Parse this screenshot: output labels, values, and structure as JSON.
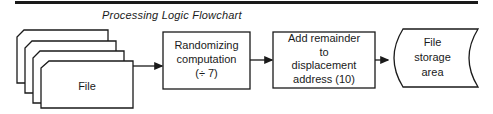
{
  "title": "Processing Logic Flowchart",
  "nodes": [
    {
      "id": "file",
      "shape": "stacked-cards",
      "label": "File",
      "count": 4
    },
    {
      "id": "randomizing",
      "shape": "process",
      "lines": [
        "Randomizing",
        "computation",
        "(÷ 7)"
      ]
    },
    {
      "id": "add-remainder",
      "shape": "process",
      "lines": [
        "Add remainder",
        "to",
        "displacement",
        "address (10)"
      ]
    },
    {
      "id": "storage",
      "shape": "stored-data",
      "lines": [
        "File",
        "storage",
        "area"
      ]
    }
  ],
  "edges": [
    {
      "from": "file",
      "to": "randomizing"
    },
    {
      "from": "randomizing",
      "to": "add-remainder"
    },
    {
      "from": "add-remainder",
      "to": "storage"
    }
  ],
  "colors": {
    "stroke": "#1a1a1a",
    "background": "#ffffff"
  }
}
